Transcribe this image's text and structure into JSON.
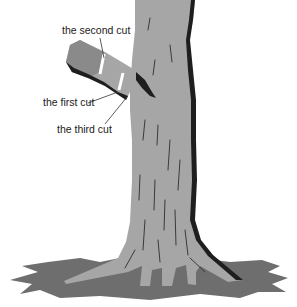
{
  "diagram": {
    "labels": {
      "second_cut": "the second cut",
      "first_cut": "the first cut",
      "third_cut": "the third cut"
    },
    "colors": {
      "background": "#ffffff",
      "bark": "#a6a6a6",
      "bark_shadow": "#1e1e1e",
      "ground_shadow": "#6e6e6e",
      "cut_mark": "#ffffff",
      "text": "#1a1a1a",
      "leader_line": "#333333"
    }
  }
}
